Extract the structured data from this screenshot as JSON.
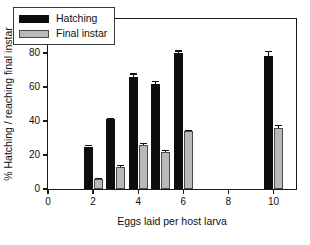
{
  "chart_data": {
    "type": "bar",
    "title": "",
    "xlabel": "Eggs laid per host larva",
    "ylabel": "% Hatching / reaching final instar",
    "xlim": [
      0,
      11
    ],
    "ylim": [
      0,
      100
    ],
    "grid": false,
    "legend_position": "upper left",
    "x": [
      2,
      3,
      4,
      5,
      6,
      10
    ],
    "categories": [
      "2",
      "3",
      "4",
      "5",
      "6",
      "10"
    ],
    "xticks": [
      0,
      2,
      4,
      6,
      8,
      10
    ],
    "xtick_labels": [
      "0",
      "2",
      "4",
      "6",
      "8",
      "10"
    ],
    "yticks": [
      0,
      20,
      40,
      60,
      80,
      100
    ],
    "ytick_labels": [
      "0",
      "20",
      "40",
      "60",
      "80",
      "100"
    ],
    "series": [
      {
        "name": "Hatching",
        "color": "#0d0d0d",
        "values": [
          25,
          41,
          66,
          62,
          80,
          78
        ],
        "errors": [
          1,
          1,
          2,
          1.5,
          1.5,
          3
        ]
      },
      {
        "name": "Final instar",
        "color": "#b9b9b9",
        "values": [
          6,
          13,
          26,
          22,
          34,
          36
        ],
        "errors": [
          0.5,
          1,
          1,
          1,
          1,
          1.5
        ]
      }
    ]
  },
  "legend": {
    "entries": [
      {
        "label": "Hatching",
        "swatch": "black-bar-swatch"
      },
      {
        "label": "Final instar",
        "swatch": "gray-bar-swatch"
      }
    ]
  },
  "axes": {
    "x_title": "Eggs laid per host larva",
    "y_title": "% Hatching / reaching final instar"
  }
}
